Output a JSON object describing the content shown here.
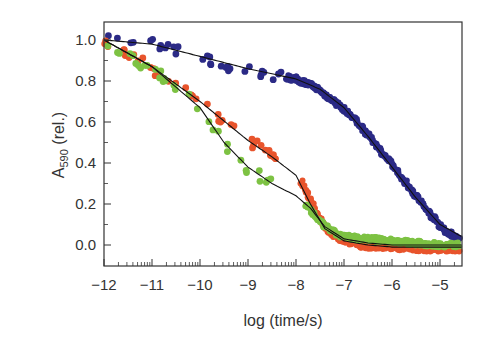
{
  "chart_data": {
    "type": "scatter",
    "title": "",
    "xlabel": "log (time/s)",
    "ylabel": "A590 (rel.)",
    "ylabel_parts": {
      "main": "A",
      "sub": "590",
      "suffix": " (rel.)"
    },
    "xlim": [
      -12,
      -4.54
    ],
    "ylim": [
      -0.1,
      1.09
    ],
    "x_ticks": [
      -12,
      -11,
      -10,
      -9,
      -8,
      -7,
      -6,
      -5
    ],
    "x_tick_labels": [
      "−12",
      "−11",
      "−10",
      "−9",
      "−8",
      "−7",
      "−6",
      "−5"
    ],
    "y_ticks": [
      0.0,
      0.2,
      0.4,
      0.6,
      0.8,
      1.0
    ],
    "y_tick_labels": [
      "0.0",
      "0.2",
      "0.4",
      "0.6",
      "0.8",
      "1.0"
    ],
    "x_minor_log_ticks": true,
    "grid": false,
    "legend": null,
    "series": [
      {
        "name": "blue",
        "color": "#2b2a86",
        "style": "dense-dots",
        "sparse_until": -8.2,
        "x": [
          -11.9,
          -11.5,
          -11.0,
          -10.5,
          -10.0,
          -9.5,
          -9.0,
          -8.5,
          -8.0,
          -7.6,
          -7.2,
          -6.8,
          -6.4,
          -6.0,
          -5.6,
          -5.2,
          -4.9,
          -4.6
        ],
        "values": [
          1.0,
          1.0,
          0.98,
          0.95,
          0.92,
          0.88,
          0.85,
          0.83,
          0.81,
          0.77,
          0.7,
          0.62,
          0.51,
          0.39,
          0.27,
          0.15,
          0.07,
          0.03
        ]
      },
      {
        "name": "red",
        "color": "#e8542c",
        "style": "dense-dots",
        "gap": [
          -8.4,
          -7.9
        ],
        "x": [
          -12.0,
          -11.5,
          -11.0,
          -10.5,
          -10.0,
          -9.5,
          -9.0,
          -8.5,
          -8.4,
          -7.9,
          -7.6,
          -7.3,
          -7.0,
          -6.5,
          -6.0,
          -5.5,
          -5.0,
          -4.6
        ],
        "values": [
          1.0,
          0.93,
          0.86,
          0.79,
          0.7,
          0.6,
          0.51,
          0.44,
          0.42,
          0.31,
          0.17,
          0.06,
          0.02,
          -0.01,
          -0.01,
          -0.02,
          -0.02,
          -0.02
        ]
      },
      {
        "name": "green",
        "color": "#7dc243",
        "style": "dense-dots",
        "gap": [
          -8.5,
          -7.8
        ],
        "x": [
          -12.0,
          -11.5,
          -11.0,
          -10.5,
          -10.0,
          -9.5,
          -9.0,
          -8.5,
          -7.8,
          -7.5,
          -7.2,
          -7.0,
          -6.5,
          -6.0,
          -5.5,
          -5.0,
          -4.6
        ],
        "values": [
          1.0,
          0.92,
          0.86,
          0.78,
          0.66,
          0.5,
          0.37,
          0.3,
          0.2,
          0.11,
          0.06,
          0.04,
          0.03,
          0.02,
          0.01,
          0.0,
          0.0
        ]
      }
    ],
    "fits": [
      {
        "name": "blue-fit",
        "color": "#111111",
        "x": [
          -12.0,
          -11.0,
          -10.0,
          -9.0,
          -8.0,
          -7.5,
          -7.0,
          -6.5,
          -6.0,
          -5.5,
          -5.0,
          -4.54
        ],
        "values": [
          1.0,
          0.98,
          0.92,
          0.86,
          0.81,
          0.76,
          0.67,
          0.53,
          0.38,
          0.23,
          0.1,
          0.04
        ]
      },
      {
        "name": "red-fit",
        "color": "#111111",
        "x": [
          -12.0,
          -11.0,
          -10.0,
          -9.0,
          -8.5,
          -8.0,
          -7.7,
          -7.4,
          -7.0,
          -6.5,
          -6.0,
          -5.0,
          -4.54
        ],
        "values": [
          1.0,
          0.87,
          0.7,
          0.51,
          0.43,
          0.34,
          0.2,
          0.08,
          0.02,
          0.0,
          -0.01,
          -0.01,
          -0.01
        ]
      },
      {
        "name": "green-fit",
        "color": "#111111",
        "x": [
          -12.0,
          -11.0,
          -10.0,
          -9.5,
          -9.0,
          -8.5,
          -8.0,
          -7.7,
          -7.4,
          -7.0,
          -6.5,
          -6.0,
          -5.0,
          -4.54
        ],
        "values": [
          1.0,
          0.87,
          0.67,
          0.5,
          0.38,
          0.3,
          0.24,
          0.18,
          0.09,
          0.03,
          0.01,
          0.0,
          0.0,
          0.0
        ]
      }
    ]
  }
}
